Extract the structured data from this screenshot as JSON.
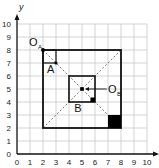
{
  "diagram": {
    "x_axis": {
      "label": "x",
      "ticks": [
        "0",
        "1",
        "2",
        "3",
        "4",
        "5",
        "6",
        "7",
        "8",
        "9",
        "10"
      ]
    },
    "y_axis": {
      "label": "y",
      "ticks": [
        "0",
        "1",
        "2",
        "3",
        "4",
        "5",
        "6",
        "7",
        "8",
        "9",
        "10"
      ]
    },
    "grid": {
      "min": 0,
      "max": 10,
      "color": "#c8c8c8"
    },
    "outer_square": {
      "x1": 2,
      "y1": 2,
      "x2": 8,
      "y2": 8
    },
    "inner_square_B": {
      "x1": 4,
      "y1": 4,
      "x2": 6,
      "y2": 6,
      "label": "B"
    },
    "square_A": {
      "x1": 2,
      "y1": 7,
      "x2": 3,
      "y2": 8,
      "label": "A"
    },
    "filled_square": {
      "x1": 7,
      "y1": 2,
      "x2": 8,
      "y2": 3
    },
    "small_filled_square": {
      "x1": 5.65,
      "y1": 4,
      "x2": 6,
      "y2": 4.35
    },
    "center_OA": {
      "x": 2,
      "y": 8,
      "label": "O",
      "sub": "A"
    },
    "center_OB": {
      "x": 5,
      "y": 5,
      "label": "O",
      "sub": "B"
    },
    "colors": {
      "line": "#111111",
      "dash": "#777777",
      "fill": "#000000"
    }
  }
}
